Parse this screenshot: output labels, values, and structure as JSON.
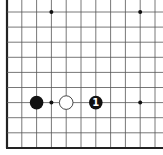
{
  "diagram": {
    "type": "go-board-fragment",
    "grid": {
      "origin_x": 7,
      "origin_y": 12,
      "spacing_x": 14.8,
      "spacing_y": 15.1,
      "cols": 11,
      "rows": 10,
      "left_edge": true,
      "bottom_edge": true,
      "line_color": "#555555",
      "edge_color": "#222222"
    },
    "star_points": [
      {
        "col": 3,
        "row": 0
      },
      {
        "col": 9,
        "row": 0
      },
      {
        "col": 3,
        "row": 6
      },
      {
        "col": 9,
        "row": 6
      }
    ],
    "stones": [
      {
        "col": 2,
        "row": 6,
        "color": "black",
        "label": ""
      },
      {
        "col": 4,
        "row": 6,
        "color": "white",
        "label": ""
      },
      {
        "col": 6,
        "row": 6,
        "color": "black",
        "label": "1"
      }
    ],
    "colors": {
      "black_stone": "#111111",
      "white_stone": "#ffffff",
      "white_stroke": "#333333",
      "label_on_black": "#ffffff"
    }
  }
}
